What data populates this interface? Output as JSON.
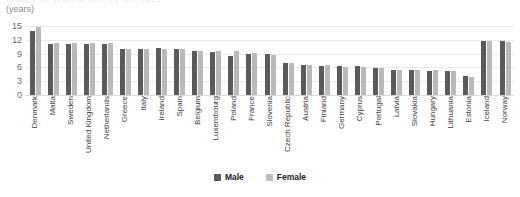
{
  "header": {
    "cut_title": "Healthy life years at birth, by sex, 2016",
    "unit_label": "(years)"
  },
  "legend": {
    "position": "bottom-center",
    "items": [
      {
        "label": "Male",
        "color": "#5b5b5b",
        "name": "legend-male"
      },
      {
        "label": "Female",
        "color": "#bdbdbd",
        "name": "legend-female"
      }
    ]
  },
  "axis": {
    "yticks": [
      "15",
      "12",
      "9",
      "6",
      "3",
      "0"
    ]
  },
  "chart_data": {
    "type": "bar",
    "title": "Healthy life years at birth, by sex, 2016",
    "xlabel": "",
    "ylabel": "(years)",
    "ylim": [
      0,
      15
    ],
    "yticks": [
      0,
      3,
      6,
      9,
      12,
      15
    ],
    "grid": true,
    "legend_position": "bottom-center",
    "categories": [
      "Denmark",
      "Malta",
      "Sweden",
      "United Kingdom",
      "Netherlands",
      "Greece",
      "Italy",
      "Ireland",
      "Spain",
      "Belgium",
      "Luxembourg",
      "Poland",
      "France",
      "Slovenia",
      "Czech Republic",
      "Austria",
      "Finland",
      "Germany",
      "Cyprus",
      "Portugal",
      "Latvia",
      "Slovakia",
      "Hungary",
      "Lithuania",
      "Estonia",
      "Iceland",
      "Norway"
    ],
    "series": [
      {
        "name": "Male",
        "color": "#5b5b5b",
        "values": [
          13.9,
          11.1,
          11.1,
          11.0,
          11.1,
          10.0,
          9.9,
          10.2,
          9.9,
          9.6,
          9.4,
          8.5,
          9.0,
          9.0,
          6.9,
          6.6,
          6.4,
          6.4,
          6.3,
          5.9,
          5.5,
          5.5,
          5.3,
          5.3,
          4.1,
          11.7,
          11.7
        ]
      },
      {
        "name": "Female",
        "color": "#b9b9b9",
        "values": [
          14.8,
          11.2,
          11.2,
          11.3,
          11.2,
          10.1,
          10.1,
          10.1,
          10.1,
          9.6,
          9.6,
          9.6,
          9.1,
          8.7,
          6.9,
          6.6,
          6.5,
          6.0,
          6.0,
          5.9,
          5.4,
          5.4,
          5.5,
          5.2,
          4.0,
          11.7,
          11.6
        ]
      }
    ]
  }
}
